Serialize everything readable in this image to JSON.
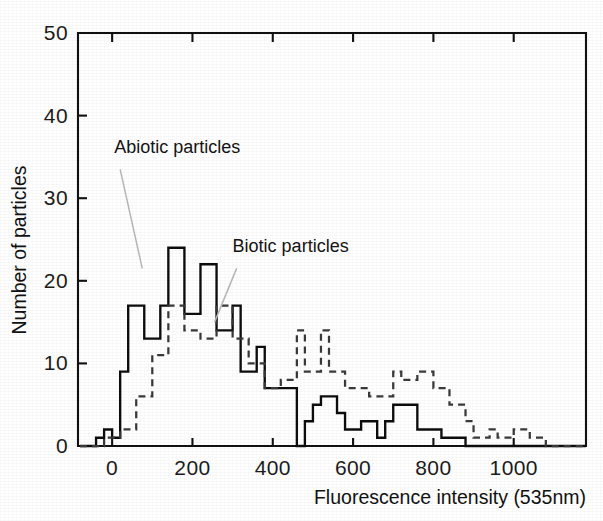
{
  "figure": {
    "kind": "scanned-histogram-figure",
    "background_color": "#ffffff"
  },
  "chart_data": {
    "type": "line",
    "subtype": "step-histogram",
    "title": "",
    "xlabel": "Fluorescence intensity (535nm)",
    "ylabel": "Number of  particles",
    "xlim": [
      -85,
      1180
    ],
    "ylim": [
      0,
      50
    ],
    "xticks": [
      0,
      200,
      400,
      600,
      800,
      1000
    ],
    "xtick_labels": [
      "0",
      "200",
      "400",
      "600",
      "800",
      "1000"
    ],
    "yticks": [
      0,
      10,
      20,
      30,
      40,
      50
    ],
    "ytick_labels": [
      "0",
      "10",
      "20",
      "30",
      "40",
      "50"
    ],
    "grid": false,
    "legend_position": "inline-annotations",
    "bin_width": 20,
    "annotations": [
      {
        "text": "Abiotic particles",
        "x_text": 5,
        "y_text": 35.5,
        "points_to_series": "Abiotic particles",
        "leader_from_x": 20,
        "leader_from_y": 33.5,
        "leader_to_x": 75,
        "leader_to_y": 21.5
      },
      {
        "text": "Biotic particles",
        "x_text": 300,
        "y_text": 23.5,
        "points_to_series": "Biotic particles",
        "leader_from_x": 310,
        "leader_from_y": 21.5,
        "leader_to_x": 255,
        "leader_to_y": 15.0
      }
    ],
    "series": [
      {
        "name": "Abiotic particles",
        "style": "solid",
        "color": "#0d0d0d",
        "bin_starts": [
          -80,
          -60,
          -40,
          -20,
          0,
          20,
          40,
          60,
          80,
          100,
          120,
          140,
          160,
          180,
          200,
          220,
          240,
          260,
          280,
          300,
          320,
          340,
          360,
          380,
          400,
          420,
          440,
          460,
          480,
          500,
          520,
          540,
          560,
          580,
          600,
          620,
          640,
          660,
          680,
          700,
          720,
          740,
          760,
          780,
          800,
          820,
          840,
          860,
          880,
          900,
          920,
          940,
          960,
          980,
          1000,
          1020,
          1040,
          1060,
          1080,
          1100,
          1120,
          1140,
          1160
        ],
        "values": [
          0,
          0,
          1,
          2,
          1,
          9,
          17,
          17,
          13,
          13,
          17,
          24,
          24,
          16,
          16,
          22,
          22,
          14,
          14,
          17,
          9,
          9,
          12,
          7,
          7,
          7,
          7,
          0,
          3,
          5,
          6,
          6,
          4,
          2,
          2,
          3,
          3,
          1,
          3,
          5,
          5,
          5,
          2,
          2,
          2,
          1,
          1,
          1,
          0,
          0,
          0,
          0,
          0,
          0,
          0,
          0,
          0,
          0,
          0,
          0,
          0,
          0,
          0
        ]
      },
      {
        "name": "Biotic particles",
        "style": "dashed",
        "color": "#3a3a3a",
        "bin_starts": [
          -80,
          -60,
          -40,
          -20,
          0,
          20,
          40,
          60,
          80,
          100,
          120,
          140,
          160,
          180,
          200,
          220,
          240,
          260,
          280,
          300,
          320,
          340,
          360,
          380,
          400,
          420,
          440,
          460,
          480,
          500,
          520,
          540,
          560,
          580,
          600,
          620,
          640,
          660,
          680,
          700,
          720,
          740,
          760,
          780,
          800,
          820,
          840,
          860,
          880,
          900,
          920,
          940,
          960,
          980,
          1000,
          1020,
          1040,
          1060,
          1080,
          1100,
          1120,
          1140,
          1160
        ],
        "values": [
          0,
          0,
          0,
          1,
          1,
          2,
          2,
          6,
          6,
          11,
          11,
          17,
          17,
          14,
          14,
          13,
          13,
          17,
          17,
          13,
          13,
          10,
          10,
          7,
          7,
          8,
          8,
          14,
          9,
          9,
          14,
          9,
          9,
          7,
          7,
          7,
          6,
          6,
          6,
          9,
          8,
          8,
          9,
          9,
          7,
          7,
          5,
          5,
          3,
          1,
          1,
          2,
          1,
          1,
          2,
          2,
          1,
          1,
          0,
          0,
          0,
          0,
          0
        ]
      }
    ]
  }
}
